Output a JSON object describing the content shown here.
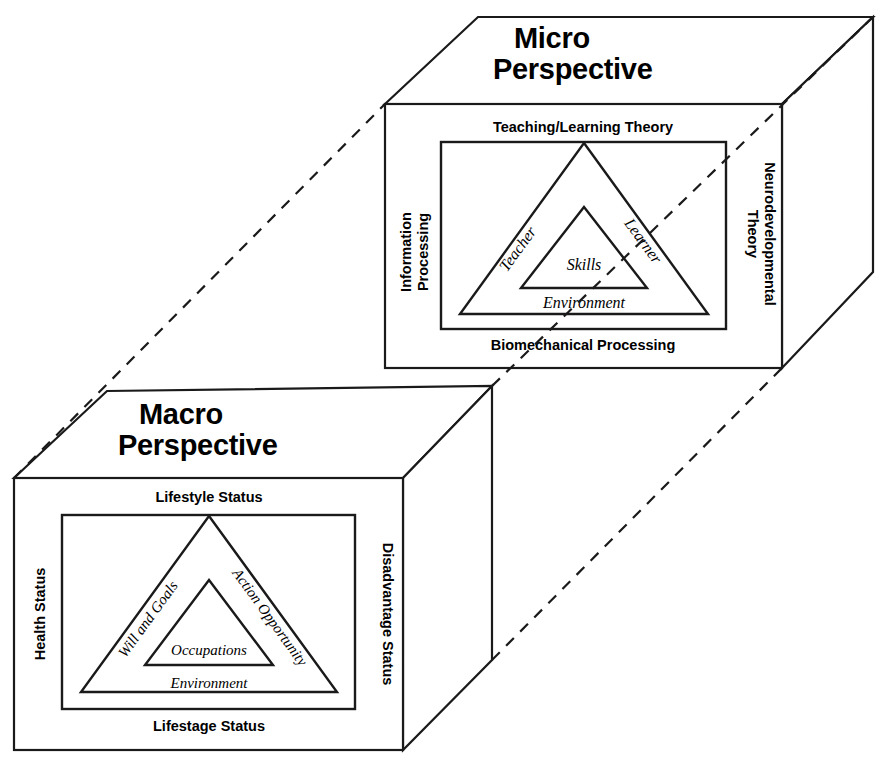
{
  "diagram": {
    "stroke_color": "#1a1a1a",
    "background_color": "#ffffff",
    "connector_style": "dashed"
  },
  "micro": {
    "title_line1": "Micro",
    "title_line2": "Perspective",
    "edge_top": "Teaching/Learning Theory",
    "edge_bottom": "Biomechanical Processing",
    "edge_left_line1": "Information",
    "edge_left_line2": "Processing",
    "edge_right_line1": "Neurodevelopmental",
    "edge_right_line2": "Theory",
    "triangle_left": "Teacher",
    "triangle_right": "Learner",
    "triangle_center": "Skills",
    "triangle_base": "Environment"
  },
  "macro": {
    "title_line1": "Macro",
    "title_line2": "Perspective",
    "edge_top": "Lifestyle Status",
    "edge_bottom": "Lifestage Status",
    "edge_left": "Health Status",
    "edge_right": "Disadvantage Status",
    "triangle_left": "Will and Goals",
    "triangle_right": "Action Opportunity",
    "triangle_center": "Occupations",
    "triangle_base": "Environment"
  }
}
